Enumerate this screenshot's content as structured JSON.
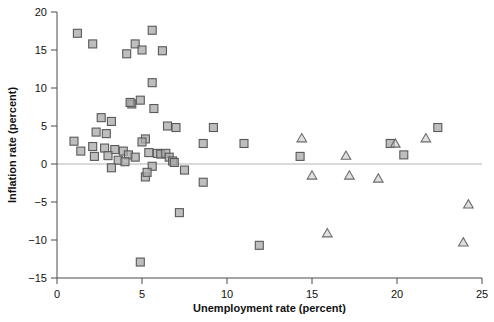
{
  "chart_data": {
    "type": "scatter",
    "title": "",
    "xlabel": "Unemployment rate (percent)",
    "ylabel": "Inflation rate (percent)",
    "xlim": [
      0,
      25
    ],
    "ylim": [
      -15,
      20
    ],
    "xticks": [
      0,
      5,
      10,
      15,
      20,
      25
    ],
    "yticks": [
      20,
      15,
      10,
      5,
      0,
      -5,
      -10,
      -15
    ],
    "xtick_labels": [
      "0",
      "5",
      "10",
      "15",
      "20",
      "25"
    ],
    "ytick_labels": [
      "20",
      "15",
      "10",
      "5",
      "0",
      "−5",
      "−10",
      "−15"
    ],
    "grid": false,
    "legend": "none",
    "reference_lines": [
      {
        "axis": "y",
        "value": 0,
        "color": "#b3b3b3"
      }
    ],
    "series": [
      {
        "name": "square-markers",
        "marker": "square",
        "color": "#a8a8a8",
        "edge_color": "#595959",
        "points": [
          [
            1.2,
            17.2
          ],
          [
            2.1,
            15.8
          ],
          [
            4.1,
            14.5
          ],
          [
            4.6,
            15.8
          ],
          [
            5.0,
            15.0
          ],
          [
            5.6,
            17.6
          ],
          [
            6.2,
            14.9
          ],
          [
            5.6,
            10.7
          ],
          [
            4.4,
            7.9
          ],
          [
            4.3,
            8.1
          ],
          [
            4.9,
            8.4
          ],
          [
            5.7,
            7.3
          ],
          [
            2.6,
            6.1
          ],
          [
            3.2,
            5.6
          ],
          [
            6.5,
            5.0
          ],
          [
            7.0,
            4.8
          ],
          [
            9.2,
            4.8
          ],
          [
            22.4,
            4.8
          ],
          [
            2.3,
            4.2
          ],
          [
            2.9,
            4.0
          ],
          [
            5.2,
            3.3
          ],
          [
            1.0,
            3.0
          ],
          [
            8.6,
            2.7
          ],
          [
            11.0,
            2.7
          ],
          [
            19.6,
            2.7
          ],
          [
            20.4,
            1.2
          ],
          [
            1.4,
            1.7
          ],
          [
            2.1,
            2.3
          ],
          [
            2.8,
            2.1
          ],
          [
            3.4,
            1.9
          ],
          [
            3.9,
            1.7
          ],
          [
            5.0,
            2.9
          ],
          [
            5.4,
            1.5
          ],
          [
            5.9,
            1.4
          ],
          [
            2.2,
            1.0
          ],
          [
            3.0,
            1.1
          ],
          [
            4.2,
            1.2
          ],
          [
            4.6,
            0.9
          ],
          [
            6.1,
            1.3
          ],
          [
            6.4,
            1.4
          ],
          [
            6.6,
            0.9
          ],
          [
            14.3,
            1.0
          ],
          [
            3.6,
            0.5
          ],
          [
            4.0,
            0.3
          ],
          [
            6.8,
            0.4
          ],
          [
            6.9,
            0.2
          ],
          [
            3.2,
            -0.5
          ],
          [
            5.6,
            -0.3
          ],
          [
            7.5,
            -0.8
          ],
          [
            5.2,
            -1.7
          ],
          [
            5.3,
            -1.1
          ],
          [
            8.6,
            -2.4
          ],
          [
            7.2,
            -6.4
          ],
          [
            11.9,
            -10.7
          ],
          [
            4.9,
            -12.9
          ]
        ]
      },
      {
        "name": "triangle-markers",
        "marker": "triangle",
        "color": "#c9c9c9",
        "edge_color": "#6b6b6b",
        "points": [
          [
            14.4,
            3.4
          ],
          [
            17.0,
            1.1
          ],
          [
            19.9,
            2.7
          ],
          [
            21.7,
            3.4
          ],
          [
            15.0,
            -1.5
          ],
          [
            17.2,
            -1.5
          ],
          [
            18.9,
            -1.9
          ],
          [
            15.9,
            -9.1
          ],
          [
            23.9,
            -10.3
          ],
          [
            24.2,
            -5.3
          ]
        ]
      }
    ]
  },
  "axes": {
    "x_title": "Unemployment rate (percent)",
    "y_title": "Inflation rate (percent)"
  }
}
